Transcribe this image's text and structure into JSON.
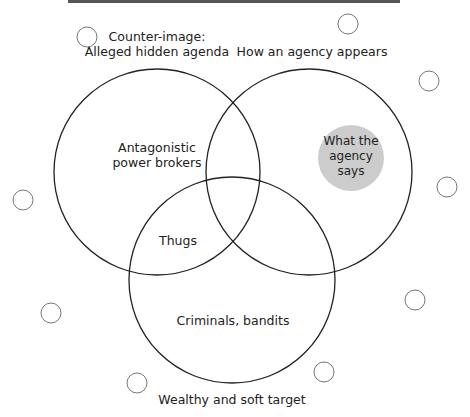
{
  "diagram": {
    "type": "venn",
    "sets": [
      {
        "name": "counter-image",
        "label_line1": "Counter-image:",
        "label_line2": "Alleged hidden agenda"
      },
      {
        "name": "agency-appearance",
        "label": "How an agency appears"
      },
      {
        "name": "target",
        "label": "Wealthy and soft target"
      }
    ],
    "regions": {
      "counter_image_only": {
        "line1": "Antagonistic",
        "line2": "power brokers"
      },
      "counter_and_target": "Thugs",
      "target_only": "Criminals, bandits",
      "agency_says": {
        "line1": "What the",
        "line2": "agency",
        "line3": "says"
      }
    },
    "colors": {
      "stroke": "#222222",
      "highlight": "#cccccc",
      "small_circle": "#666666",
      "rule": "#555555"
    }
  }
}
